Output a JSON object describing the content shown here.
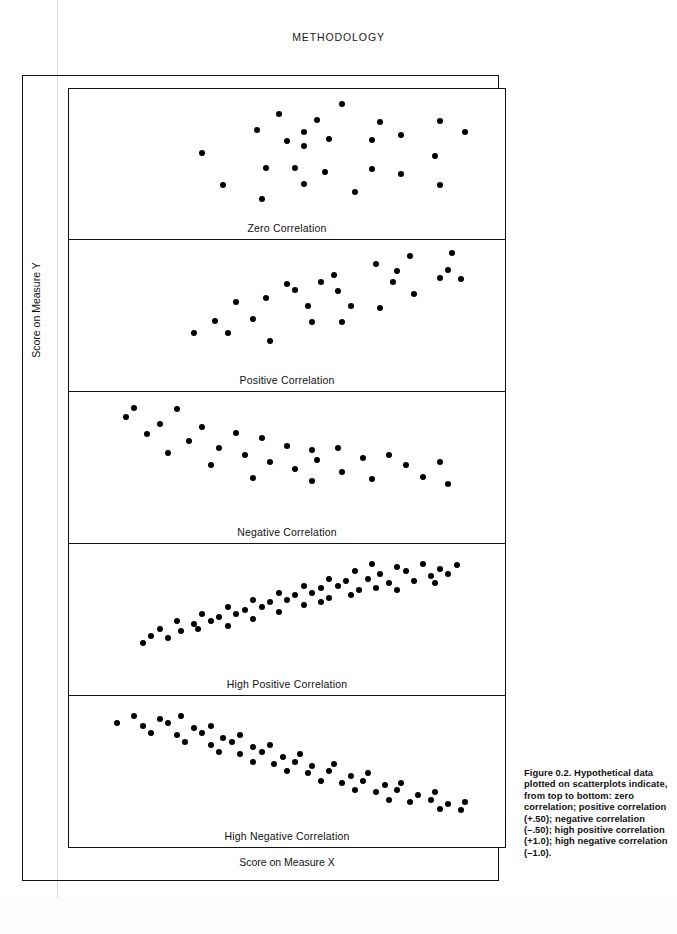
{
  "page": {
    "running_head": "METHODOLOGY"
  },
  "axes": {
    "y_label": "Score on Measure Y",
    "x_label": "Score on Measure X"
  },
  "caption": {
    "text": "Figure 0.2.  Hypothetical data plotted on scatterplots indicate, from top to bottom: zero correlation; positive correlation (+.50); negative correlation (–.50); high positive correlation (+1.0); high negative correlation (–1.0)."
  },
  "chart_data": [
    {
      "type": "scatter",
      "title": "Zero Correlation",
      "xlabel": "Score on Measure X",
      "ylabel": "Score on Measure Y",
      "xlim": [
        0,
        100
      ],
      "ylim": [
        0,
        100
      ],
      "grid": false,
      "correlation": 0.0,
      "points": [
        [
          63,
          92
        ],
        [
          48,
          84
        ],
        [
          57,
          79
        ],
        [
          54,
          69
        ],
        [
          72,
          77
        ],
        [
          86,
          78
        ],
        [
          43,
          70
        ],
        [
          60,
          63
        ],
        [
          70,
          62
        ],
        [
          77,
          66
        ],
        [
          92,
          69
        ],
        [
          50,
          61
        ],
        [
          54,
          57
        ],
        [
          30,
          51
        ],
        [
          85,
          48
        ],
        [
          45,
          38
        ],
        [
          52,
          38
        ],
        [
          70,
          37
        ],
        [
          59,
          35
        ],
        [
          77,
          33
        ],
        [
          35,
          24
        ],
        [
          54,
          25
        ],
        [
          86,
          24
        ],
        [
          66,
          18
        ],
        [
          44,
          12
        ]
      ]
    },
    {
      "type": "scatter",
      "title": "Positive Correlation",
      "xlabel": "Score on Measure X",
      "ylabel": "Score on Measure Y",
      "xlim": [
        0,
        100
      ],
      "ylim": [
        0,
        100
      ],
      "grid": false,
      "correlation": 0.5,
      "points": [
        [
          79,
          92
        ],
        [
          89,
          94
        ],
        [
          71,
          85
        ],
        [
          76,
          79
        ],
        [
          61,
          76
        ],
        [
          88,
          80
        ],
        [
          58,
          70
        ],
        [
          50,
          68
        ],
        [
          52,
          63
        ],
        [
          75,
          70
        ],
        [
          86,
          73
        ],
        [
          91,
          72
        ],
        [
          62,
          62
        ],
        [
          80,
          60
        ],
        [
          45,
          56
        ],
        [
          38,
          53
        ],
        [
          55,
          50
        ],
        [
          65,
          50
        ],
        [
          72,
          48
        ],
        [
          33,
          37
        ],
        [
          42,
          39
        ],
        [
          56,
          36
        ],
        [
          63,
          36
        ],
        [
          28,
          27
        ],
        [
          36,
          27
        ],
        [
          46,
          20
        ]
      ]
    },
    {
      "type": "scatter",
      "title": "Negative Correlation",
      "xlabel": "Score on Measure X",
      "ylabel": "Score on Measure Y",
      "xlim": [
        0,
        100
      ],
      "ylim": [
        0,
        100
      ],
      "grid": false,
      "correlation": -0.5,
      "points": [
        [
          14,
          92
        ],
        [
          24,
          91
        ],
        [
          12,
          84
        ],
        [
          20,
          78
        ],
        [
          30,
          76
        ],
        [
          17,
          70
        ],
        [
          38,
          71
        ],
        [
          27,
          64
        ],
        [
          44,
          66
        ],
        [
          34,
          58
        ],
        [
          50,
          60
        ],
        [
          22,
          54
        ],
        [
          40,
          52
        ],
        [
          56,
          56
        ],
        [
          62,
          58
        ],
        [
          46,
          46
        ],
        [
          32,
          44
        ],
        [
          57,
          48
        ],
        [
          68,
          50
        ],
        [
          74,
          52
        ],
        [
          52,
          40
        ],
        [
          42,
          33
        ],
        [
          63,
          38
        ],
        [
          78,
          44
        ],
        [
          86,
          46
        ],
        [
          56,
          30
        ],
        [
          70,
          32
        ],
        [
          82,
          34
        ],
        [
          88,
          28
        ]
      ]
    },
    {
      "type": "scatter",
      "title": "High Positive Correlation",
      "xlabel": "Score on Measure X",
      "ylabel": "Score on Measure Y",
      "xlim": [
        0,
        100
      ],
      "ylim": [
        0,
        100
      ],
      "grid": false,
      "correlation": 1.0,
      "points": [
        [
          70,
          88
        ],
        [
          76,
          86
        ],
        [
          82,
          88
        ],
        [
          86,
          84
        ],
        [
          90,
          87
        ],
        [
          66,
          82
        ],
        [
          72,
          80
        ],
        [
          78,
          82
        ],
        [
          84,
          78
        ],
        [
          88,
          80
        ],
        [
          60,
          76
        ],
        [
          64,
          74
        ],
        [
          69,
          76
        ],
        [
          74,
          72
        ],
        [
          80,
          74
        ],
        [
          85,
          72
        ],
        [
          54,
          70
        ],
        [
          58,
          68
        ],
        [
          62,
          70
        ],
        [
          67,
          66
        ],
        [
          71,
          68
        ],
        [
          76,
          66
        ],
        [
          48,
          64
        ],
        [
          52,
          62
        ],
        [
          56,
          64
        ],
        [
          60,
          60
        ],
        [
          65,
          62
        ],
        [
          42,
          58
        ],
        [
          46,
          56
        ],
        [
          50,
          58
        ],
        [
          54,
          54
        ],
        [
          58,
          56
        ],
        [
          36,
          52
        ],
        [
          40,
          50
        ],
        [
          44,
          52
        ],
        [
          48,
          48
        ],
        [
          30,
          46
        ],
        [
          34,
          44
        ],
        [
          38,
          46
        ],
        [
          42,
          42
        ],
        [
          24,
          40
        ],
        [
          28,
          38
        ],
        [
          32,
          40
        ],
        [
          36,
          36
        ],
        [
          20,
          34
        ],
        [
          25,
          32
        ],
        [
          29,
          34
        ],
        [
          18,
          28
        ],
        [
          22,
          26
        ],
        [
          16,
          22
        ]
      ]
    },
    {
      "type": "scatter",
      "title": "High Negative Correlation",
      "xlabel": "Score on Measure X",
      "ylabel": "Score on Measure Y",
      "xlim": [
        0,
        100
      ],
      "ylim": [
        0,
        100
      ],
      "grid": false,
      "correlation": -1.0,
      "points": [
        [
          14,
          88
        ],
        [
          20,
          86
        ],
        [
          25,
          88
        ],
        [
          10,
          82
        ],
        [
          16,
          80
        ],
        [
          22,
          82
        ],
        [
          28,
          78
        ],
        [
          32,
          80
        ],
        [
          18,
          74
        ],
        [
          24,
          72
        ],
        [
          30,
          74
        ],
        [
          35,
          70
        ],
        [
          39,
          72
        ],
        [
          26,
          66
        ],
        [
          32,
          64
        ],
        [
          37,
          66
        ],
        [
          42,
          62
        ],
        [
          46,
          64
        ],
        [
          34,
          58
        ],
        [
          39,
          56
        ],
        [
          44,
          58
        ],
        [
          49,
          54
        ],
        [
          53,
          56
        ],
        [
          42,
          50
        ],
        [
          47,
          48
        ],
        [
          52,
          50
        ],
        [
          56,
          46
        ],
        [
          61,
          48
        ],
        [
          50,
          42
        ],
        [
          55,
          40
        ],
        [
          60,
          42
        ],
        [
          65,
          38
        ],
        [
          69,
          40
        ],
        [
          58,
          34
        ],
        [
          63,
          32
        ],
        [
          68,
          34
        ],
        [
          73,
          30
        ],
        [
          77,
          32
        ],
        [
          66,
          26
        ],
        [
          71,
          24
        ],
        [
          76,
          26
        ],
        [
          81,
          22
        ],
        [
          85,
          24
        ],
        [
          74,
          18
        ],
        [
          79,
          16
        ],
        [
          84,
          18
        ],
        [
          88,
          14
        ],
        [
          92,
          16
        ],
        [
          86,
          10
        ],
        [
          91,
          9
        ]
      ]
    }
  ],
  "panels": [
    {
      "label": "Zero Correlation"
    },
    {
      "label": "Positive Correlation"
    },
    {
      "label": "Negative Correlation"
    },
    {
      "label": "High Positive Correlation"
    },
    {
      "label": "High Negative Correlation"
    }
  ]
}
